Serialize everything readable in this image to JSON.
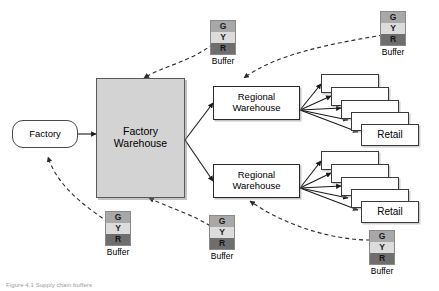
{
  "figure": {
    "caption": "Figure 4.1  Supply chain buffers",
    "background_color": "#ffffff"
  },
  "palette": {
    "green_band": "#a8a8a8",
    "yellow_band": "#dcdcdc",
    "red_band": "#6e6e6e",
    "factory_warehouse_fill": "#d3d3d3",
    "node_fill": "#ffffff",
    "stroke": "#000000"
  },
  "nodes": {
    "factory": {
      "label": "Factory"
    },
    "factory_warehouse": {
      "label": "Factory\nWarehouse"
    },
    "regional_warehouse_top": {
      "label": "Regional\nWarehouse"
    },
    "regional_warehouse_bottom": {
      "label": "Regional\nWarehouse"
    },
    "retail_top": {
      "label": "Retail"
    },
    "retail_bottom": {
      "label": "Retail"
    }
  },
  "buffer_bands": {
    "green": "G",
    "yellow": "Y",
    "red": "R"
  },
  "buffers": [
    {
      "id": "buffer-factory-warehouse-top",
      "caption": "Buffer"
    },
    {
      "id": "buffer-regional-top",
      "caption": "Buffer"
    },
    {
      "id": "buffer-factory",
      "caption": "Buffer"
    },
    {
      "id": "buffer-factory-warehouse-bottom",
      "caption": "Buffer"
    },
    {
      "id": "buffer-regional-bottom",
      "caption": "Buffer"
    }
  ]
}
